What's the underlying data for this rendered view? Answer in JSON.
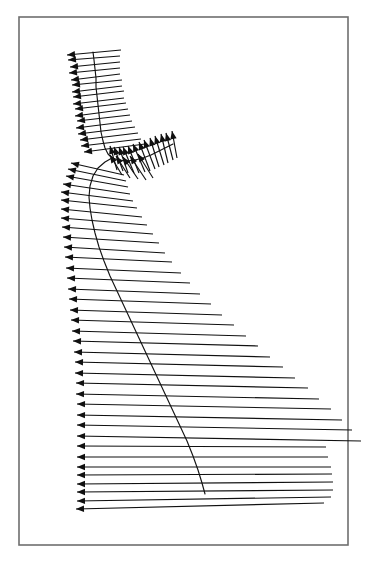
{
  "figure": {
    "title": "",
    "width": 367,
    "height": 562,
    "background_color": "#ffffff"
  },
  "frame": {
    "x": 19,
    "y": 17,
    "width": 329,
    "height": 528,
    "stroke_color": "#6e6e6e",
    "stroke_width": 1.6,
    "fill_color": "#ffffff"
  },
  "style": {
    "arrow_color": "#101010",
    "spine_color": "#141414",
    "arrow_stroke_width": 1.15,
    "spine_stroke_width": 1.15,
    "head_length": 8,
    "head_half_width": 3.2
  },
  "chart_data": {
    "type": "quiver",
    "title": "",
    "subtitle": "",
    "xlabel": "",
    "ylabel": "",
    "grid": false,
    "legend": null,
    "axis_visible": false,
    "tick_labels_x": [],
    "tick_labels_y": [],
    "xlim": [
      19,
      348
    ],
    "ylim": [
      17,
      545
    ],
    "spine_main": [
      [
        93,
        52
      ],
      [
        94,
        60
      ],
      [
        95,
        69
      ],
      [
        96,
        78
      ],
      [
        96,
        87
      ],
      [
        97,
        96
      ],
      [
        98,
        105
      ],
      [
        99,
        114
      ],
      [
        100,
        123
      ],
      [
        101,
        132
      ],
      [
        103,
        141
      ],
      [
        105,
        148
      ],
      [
        108,
        154
      ],
      [
        112,
        158
      ],
      [
        105,
        162
      ],
      [
        98,
        168
      ],
      [
        93,
        176
      ],
      [
        90,
        186
      ],
      [
        89,
        197
      ],
      [
        90,
        208
      ],
      [
        92,
        220
      ],
      [
        95,
        233
      ],
      [
        99,
        247
      ],
      [
        104,
        261
      ],
      [
        110,
        276
      ],
      [
        117,
        291
      ],
      [
        124,
        306
      ],
      [
        131,
        321
      ],
      [
        138,
        336
      ],
      [
        145,
        351
      ],
      [
        152,
        366
      ],
      [
        159,
        381
      ],
      [
        166,
        396
      ],
      [
        173,
        411
      ],
      [
        180,
        426
      ],
      [
        187,
        441
      ],
      [
        193,
        456
      ],
      [
        198,
        470
      ],
      [
        202,
        483
      ],
      [
        205,
        494
      ]
    ],
    "spine_branch": [
      [
        112,
        158
      ],
      [
        119,
        160
      ],
      [
        127,
        161
      ],
      [
        135,
        160
      ],
      [
        143,
        158
      ],
      [
        151,
        155
      ],
      [
        159,
        151
      ],
      [
        167,
        147
      ],
      [
        173,
        144
      ]
    ],
    "vectors_main": [
      {
        "x": 93,
        "y": 52,
        "dx": -26,
        "dy": 3,
        "tail_dx": 28,
        "tail_dy": -2
      },
      {
        "x": 93,
        "y": 57,
        "dx": -25,
        "dy": 3,
        "tail_dx": 27,
        "tail_dy": -1
      },
      {
        "x": 94,
        "y": 63,
        "dx": -24,
        "dy": 4,
        "tail_dx": 26,
        "tail_dy": -1
      },
      {
        "x": 94,
        "y": 69,
        "dx": -25,
        "dy": 4,
        "tail_dx": 26,
        "tail_dy": -1
      },
      {
        "x": 95,
        "y": 75,
        "dx": -24,
        "dy": 5,
        "tail_dx": 25,
        "tail_dy": -1
      },
      {
        "x": 95,
        "y": 81,
        "dx": -23,
        "dy": 4,
        "tail_dx": 27,
        "tail_dy": -1
      },
      {
        "x": 96,
        "y": 87,
        "dx": -24,
        "dy": 5,
        "tail_dx": 26,
        "tail_dy": -1
      },
      {
        "x": 96,
        "y": 93,
        "dx": -23,
        "dy": 4,
        "tail_dx": 28,
        "tail_dy": -2
      },
      {
        "x": 97,
        "y": 99,
        "dx": -24,
        "dy": 5,
        "tail_dx": 27,
        "tail_dy": -1
      },
      {
        "x": 97,
        "y": 105,
        "dx": -22,
        "dy": 4,
        "tail_dx": 29,
        "tail_dy": -2
      },
      {
        "x": 98,
        "y": 111,
        "dx": -23,
        "dy": 5,
        "tail_dx": 30,
        "tail_dy": -2
      },
      {
        "x": 99,
        "y": 117,
        "dx": -22,
        "dy": 4,
        "tail_dx": 31,
        "tail_dy": -2
      },
      {
        "x": 99,
        "y": 123,
        "dx": -23,
        "dy": 5,
        "tail_dx": 33,
        "tail_dy": -2
      },
      {
        "x": 100,
        "y": 129,
        "dx": -22,
        "dy": 5,
        "tail_dx": 35,
        "tail_dy": -2
      },
      {
        "x": 101,
        "y": 135,
        "dx": -21,
        "dy": 5,
        "tail_dx": 37,
        "tail_dy": -2
      },
      {
        "x": 102,
        "y": 141,
        "dx": -21,
        "dy": 5,
        "tail_dx": 39,
        "tail_dy": -2
      },
      {
        "x": 104,
        "y": 147,
        "dx": -20,
        "dy": 5,
        "tail_dx": 41,
        "tail_dy": -3
      },
      {
        "x": 96,
        "y": 170,
        "dx": -25,
        "dy": -7,
        "tail_dx": 28,
        "tail_dy": 5
      },
      {
        "x": 94,
        "y": 176,
        "dx": -26,
        "dy": -7,
        "tail_dx": 32,
        "tail_dy": 5
      },
      {
        "x": 92,
        "y": 182,
        "dx": -26,
        "dy": -6,
        "tail_dx": 36,
        "tail_dy": 5
      },
      {
        "x": 90,
        "y": 189,
        "dx": -27,
        "dy": -5,
        "tail_dx": 40,
        "tail_dy": 5
      },
      {
        "x": 89,
        "y": 196,
        "dx": -28,
        "dy": -4,
        "tail_dx": 44,
        "tail_dy": 5
      },
      {
        "x": 89,
        "y": 203,
        "dx": -28,
        "dy": -3,
        "tail_dx": 48,
        "tail_dy": 5
      },
      {
        "x": 90,
        "y": 211,
        "dx": -29,
        "dy": -2,
        "tail_dx": 52,
        "tail_dy": 6
      },
      {
        "x": 91,
        "y": 219,
        "dx": -30,
        "dy": -1,
        "tail_dx": 56,
        "tail_dy": 6
      },
      {
        "x": 93,
        "y": 227,
        "dx": -31,
        "dy": 0,
        "tail_dx": 60,
        "tail_dy": 7
      },
      {
        "x": 95,
        "y": 236,
        "dx": -32,
        "dy": 1,
        "tail_dx": 64,
        "tail_dy": 7
      },
      {
        "x": 97,
        "y": 245,
        "dx": -33,
        "dy": 2,
        "tail_dx": 68,
        "tail_dy": 8
      },
      {
        "x": 100,
        "y": 254,
        "dx": -35,
        "dy": 3,
        "tail_dx": 72,
        "tail_dy": 8
      },
      {
        "x": 103,
        "y": 264,
        "dx": -37,
        "dy": 4,
        "tail_dx": 78,
        "tail_dy": 9
      },
      {
        "x": 106,
        "y": 274,
        "dx": -39,
        "dy": 4,
        "tail_dx": 84,
        "tail_dy": 9
      },
      {
        "x": 110,
        "y": 284,
        "dx": -42,
        "dy": 5,
        "tail_dx": 90,
        "tail_dy": 10
      },
      {
        "x": 114,
        "y": 294,
        "dx": -45,
        "dy": 5,
        "tail_dx": 97,
        "tail_dy": 10
      },
      {
        "x": 118,
        "y": 304,
        "dx": -48,
        "dy": 6,
        "tail_dx": 104,
        "tail_dy": 11
      },
      {
        "x": 122,
        "y": 314,
        "dx": -51,
        "dy": 6,
        "tail_dx": 112,
        "tail_dy": 11
      },
      {
        "x": 126,
        "y": 324,
        "dx": -54,
        "dy": 7,
        "tail_dx": 120,
        "tail_dy": 12
      },
      {
        "x": 130,
        "y": 334,
        "dx": -57,
        "dy": 7,
        "tail_dx": 128,
        "tail_dy": 12
      },
      {
        "x": 134,
        "y": 344,
        "dx": -60,
        "dy": 8,
        "tail_dx": 136,
        "tail_dy": 13
      },
      {
        "x": 139,
        "y": 354,
        "dx": -64,
        "dy": 8,
        "tail_dx": 144,
        "tail_dy": 13
      },
      {
        "x": 143,
        "y": 364,
        "dx": -68,
        "dy": 9,
        "tail_dx": 152,
        "tail_dy": 14
      },
      {
        "x": 148,
        "y": 374,
        "dx": -72,
        "dy": 9,
        "tail_dx": 160,
        "tail_dy": 14
      },
      {
        "x": 152,
        "y": 384,
        "dx": -76,
        "dy": 10,
        "tail_dx": 167,
        "tail_dy": 15
      },
      {
        "x": 157,
        "y": 394,
        "dx": -80,
        "dy": 10,
        "tail_dx": 174,
        "tail_dy": 15
      },
      {
        "x": 162,
        "y": 404,
        "dx": -85,
        "dy": 11,
        "tail_dx": 180,
        "tail_dy": 16
      },
      {
        "x": 166,
        "y": 414,
        "dx": -89,
        "dy": 11,
        "tail_dx": 186,
        "tail_dy": 16
      },
      {
        "x": 171,
        "y": 424,
        "dx": -94,
        "dy": 12,
        "tail_dx": 190,
        "tail_dy": 17
      },
      {
        "x": 176,
        "y": 434,
        "dx": -99,
        "dy": 12,
        "tail_dx": 150,
        "tail_dy": 13
      },
      {
        "x": 180,
        "y": 444,
        "dx": -103,
        "dy": 13,
        "tail_dx": 148,
        "tail_dy": 13
      },
      {
        "x": 185,
        "y": 454,
        "dx": -108,
        "dy": 13,
        "tail_dx": 146,
        "tail_dy": 13
      },
      {
        "x": 189,
        "y": 462,
        "dx": -112,
        "dy": 13,
        "tail_dx": 143,
        "tail_dy": 12
      },
      {
        "x": 193,
        "y": 470,
        "dx": -116,
        "dy": 14,
        "tail_dx": 140,
        "tail_dy": 12
      },
      {
        "x": 197,
        "y": 478,
        "dx": -120,
        "dy": 14,
        "tail_dx": 136,
        "tail_dy": 12
      },
      {
        "x": 201,
        "y": 486,
        "dx": -124,
        "dy": 15,
        "tail_dx": 130,
        "tail_dy": 11
      },
      {
        "x": 204,
        "y": 493,
        "dx": -128,
        "dy": 16,
        "tail_dx": 120,
        "tail_dy": 10
      }
    ],
    "vectors_branch": [
      {
        "x": 114,
        "y": 159,
        "dx": -4,
        "dy": -13,
        "tail_dx": 3,
        "tail_dy": 11
      },
      {
        "x": 119,
        "y": 160,
        "dx": -5,
        "dy": -13,
        "tail_dx": 4,
        "tail_dy": 11
      },
      {
        "x": 124,
        "y": 161,
        "dx": -5,
        "dy": -14,
        "tail_dx": 4,
        "tail_dy": 12
      },
      {
        "x": 129,
        "y": 161,
        "dx": -6,
        "dy": -14,
        "tail_dx": 5,
        "tail_dy": 12
      },
      {
        "x": 134,
        "y": 160,
        "dx": -6,
        "dy": -14,
        "tail_dx": 5,
        "tail_dy": 13
      },
      {
        "x": 139,
        "y": 159,
        "dx": -6,
        "dy": -15,
        "tail_dx": 6,
        "tail_dy": 13
      },
      {
        "x": 144,
        "y": 157,
        "dx": -5,
        "dy": -15,
        "tail_dx": 6,
        "tail_dy": 14
      },
      {
        "x": 149,
        "y": 155,
        "dx": -5,
        "dy": -15,
        "tail_dx": 6,
        "tail_dy": 14
      },
      {
        "x": 154,
        "y": 153,
        "dx": -4,
        "dy": -15,
        "tail_dx": 5,
        "tail_dy": 14
      },
      {
        "x": 159,
        "y": 151,
        "dx": -4,
        "dy": -15,
        "tail_dx": 5,
        "tail_dy": 14
      },
      {
        "x": 164,
        "y": 149,
        "dx": -3,
        "dy": -15,
        "tail_dx": 4,
        "tail_dy": 14
      },
      {
        "x": 169,
        "y": 147,
        "dx": -3,
        "dy": -14,
        "tail_dx": 4,
        "tail_dy": 13
      },
      {
        "x": 174,
        "y": 145,
        "dx": -2,
        "dy": -14,
        "tail_dx": 3,
        "tail_dy": 13
      }
    ],
    "vectors_branch_lower": [
      {
        "x": 113,
        "y": 166,
        "dx": -3,
        "dy": -11,
        "tail_dx": 9,
        "tail_dy": 9
      },
      {
        "x": 120,
        "y": 168,
        "dx": -4,
        "dy": -12,
        "tail_dx": 10,
        "tail_dy": 10
      },
      {
        "x": 127,
        "y": 169,
        "dx": -4,
        "dy": -12,
        "tail_dx": 11,
        "tail_dy": 10
      },
      {
        "x": 134,
        "y": 169,
        "dx": -4,
        "dy": -13,
        "tail_dx": 12,
        "tail_dy": 11
      },
      {
        "x": 141,
        "y": 167,
        "dx": -3,
        "dy": -13,
        "tail_dx": 12,
        "tail_dy": 11
      }
    ]
  }
}
